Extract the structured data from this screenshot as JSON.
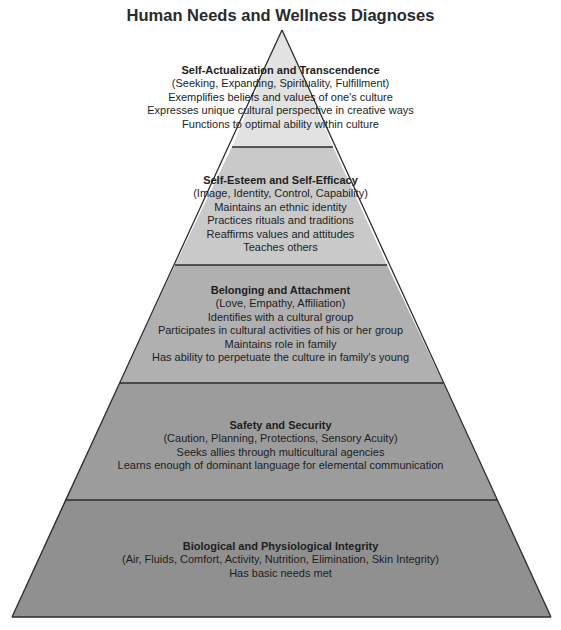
{
  "title": "Human Needs and Wellness Diagnoses",
  "colors": {
    "outline": "#2b2b2b",
    "tier_1": "#e2e2e2",
    "tier_2": "#c9c9c9",
    "tier_3": "#b0b0b0",
    "tier_4": "#9c9c9c",
    "tier_5": "#909090"
  },
  "tiers": [
    {
      "heading": "Self-Actualization and Transcendence",
      "subheading": "(Seeking, Expanding, Spirituality, Fulfillment)",
      "items": [
        "Exemplifies beliefs and values of one's culture",
        "Expresses unique cultural perspective in creative ways",
        "Functions to optimal ability within culture"
      ]
    },
    {
      "heading": "Self-Esteem and Self-Efficacy",
      "subheading": "(Image, Identity, Control, Capability)",
      "items": [
        "Maintains an ethnic identity",
        "Practices rituals and traditions",
        "Reaffirms values and attitudes",
        "Teaches others"
      ]
    },
    {
      "heading": "Belonging and Attachment",
      "subheading": "(Love, Empathy, Affiliation)",
      "items": [
        "Identifies with a cultural group",
        "Participates in cultural activities of his or her group",
        "Maintains role in family",
        "Has ability to perpetuate the culture in family's young"
      ]
    },
    {
      "heading": "Safety and Security",
      "subheading": "(Caution, Planning, Protections, Sensory Acuity)",
      "items": [
        "Seeks allies through multicultural agencies",
        "Learns enough of dominant language for elemental communication"
      ]
    },
    {
      "heading": "Biological and Physiological Integrity",
      "subheading": "(Air, Fluids, Comfort, Activity, Nutrition, Elimination, Skin Integrity)",
      "items": [
        "Has basic needs met"
      ]
    }
  ]
}
